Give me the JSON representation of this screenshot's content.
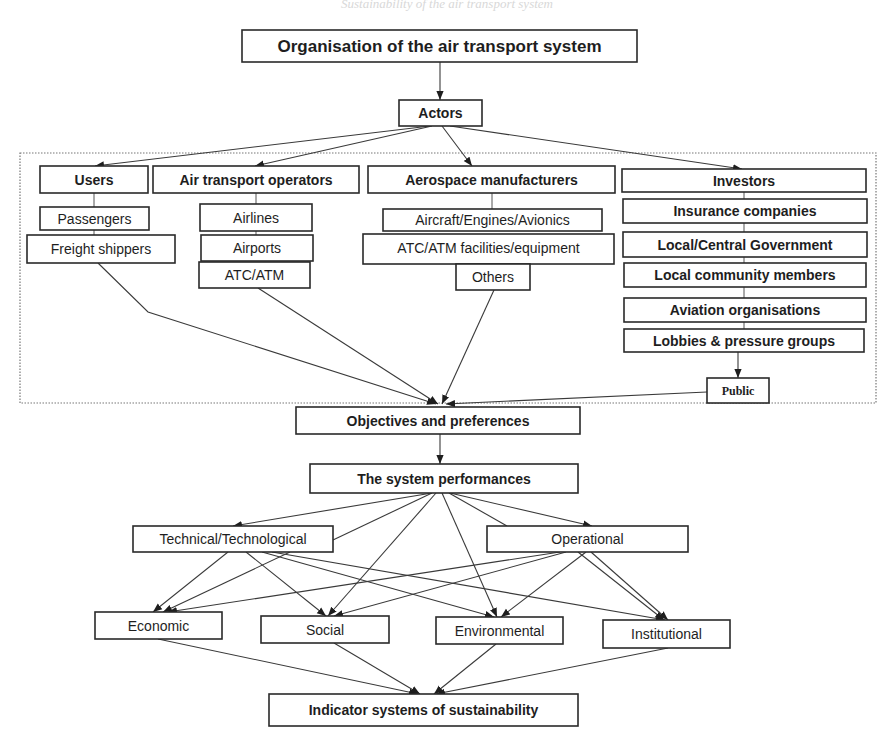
{
  "page_header": "Sustainability of the air transport system",
  "title": "Organisation of the air transport system",
  "actors": "Actors",
  "groups": {
    "users": {
      "label": "Users",
      "items": [
        "Passengers",
        "Freight shippers"
      ]
    },
    "operators": {
      "label": "Air transport operators",
      "items": [
        "Airlines",
        "Airports",
        "ATC/ATM"
      ]
    },
    "manufacturers": {
      "label": "Aerospace manufacturers",
      "items": [
        "Aircraft/Engines/Avionics",
        "ATC/ATM facilities/equipment",
        "Others"
      ]
    },
    "investors": {
      "label": "Investors",
      "items": [
        "Insurance companies",
        "Local/Central Government",
        "Local community members",
        "Aviation organisations",
        "Lobbies & pressure groups"
      ]
    }
  },
  "public": "Public",
  "objectives": "Objectives and preferences",
  "performances": "The system performances",
  "performance_types": [
    "Technical/Technological",
    "Operational"
  ],
  "dimensions": [
    "Economic",
    "Social",
    "Environmental",
    "Institutional"
  ],
  "indicator": "Indicator systems of sustainability",
  "colors": {
    "line": "#3a3a3a",
    "box_border": "#2a2a2a",
    "text": "#1e1e1e",
    "background": "#ffffff"
  }
}
